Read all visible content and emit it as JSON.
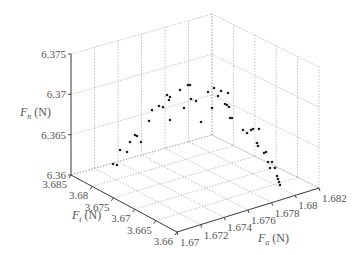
{
  "chart_data": {
    "type": "scatter",
    "projection": "3d",
    "title": "",
    "axes": {
      "x": {
        "label_main": "F",
        "label_sub": "a",
        "label_unit": " (N)",
        "ticks": [
          "1.67",
          "1.672",
          "1.674",
          "1.676",
          "1.678",
          "1.68",
          "1.682"
        ],
        "range": [
          1.67,
          1.682
        ]
      },
      "y": {
        "label_main": "F",
        "label_sub": "t",
        "label_unit": " (N)",
        "ticks": [
          "3.685",
          "3.68",
          "3.675",
          "3.67",
          "3.665",
          "3.66"
        ],
        "range": [
          3.66,
          3.685
        ]
      },
      "z": {
        "label_main": "F",
        "label_sub": "n",
        "label_unit": " (N)",
        "ticks": [
          "6.375",
          "6.37",
          "6.365",
          "6.36"
        ],
        "range": [
          6.36,
          6.375
        ]
      }
    },
    "grid": true,
    "legend": null,
    "series": [
      {
        "name": "measured force",
        "marker": "dot",
        "projected_points_px": [
          [
            113,
            164
          ],
          [
            117,
            165
          ],
          [
            120,
            150
          ],
          [
            127,
            152
          ],
          [
            130,
            142
          ],
          [
            135,
            135
          ],
          [
            137,
            136
          ],
          [
            141,
            142
          ],
          [
            149,
            121
          ],
          [
            170,
            120
          ],
          [
            152,
            110
          ],
          [
            159,
            106
          ],
          [
            163,
            107
          ],
          [
            167,
            95
          ],
          [
            169,
            100
          ],
          [
            170,
            97
          ],
          [
            180,
            90
          ],
          [
            184,
            108
          ],
          [
            188,
            85
          ],
          [
            190,
            85
          ],
          [
            191,
            99
          ],
          [
            196,
            101
          ],
          [
            201,
            122
          ],
          [
            208,
            92
          ],
          [
            212,
            108
          ],
          [
            214,
            88
          ],
          [
            218,
            96
          ],
          [
            221,
            91
          ],
          [
            228,
            93
          ],
          [
            225,
            104
          ],
          [
            229,
            107
          ],
          [
            232,
            118
          ],
          [
            227,
            105
          ],
          [
            230,
            118
          ],
          [
            243,
            130
          ],
          [
            247,
            133
          ],
          [
            251,
            130
          ],
          [
            253,
            129
          ],
          [
            259,
            129
          ],
          [
            257,
            143
          ],
          [
            258,
            146
          ],
          [
            264,
            153
          ],
          [
            266,
            152
          ],
          [
            268,
            162
          ],
          [
            272,
            162
          ],
          [
            270,
            168
          ],
          [
            275,
            168
          ],
          [
            277,
            176
          ],
          [
            278,
            179
          ],
          [
            279,
            182
          ],
          [
            280,
            185
          ]
        ]
      }
    ]
  }
}
